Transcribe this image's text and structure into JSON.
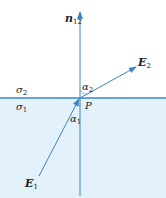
{
  "diagram": {
    "normal_label": "n",
    "normal_sub": "12",
    "e2_label": "E",
    "e2_sub": "2",
    "e1_label": "E",
    "e1_sub": "1",
    "alpha2_label": "α",
    "alpha2_sub": "2",
    "alpha1_label": "α",
    "alpha1_sub": "1",
    "sigma2_label": "σ",
    "sigma2_sub": "2",
    "sigma1_label": "σ",
    "sigma1_sub": "1",
    "point_label": "P",
    "colors": {
      "line": "#3a86c8",
      "lower_fill": "#e3f2fa",
      "text": "#222222"
    }
  }
}
